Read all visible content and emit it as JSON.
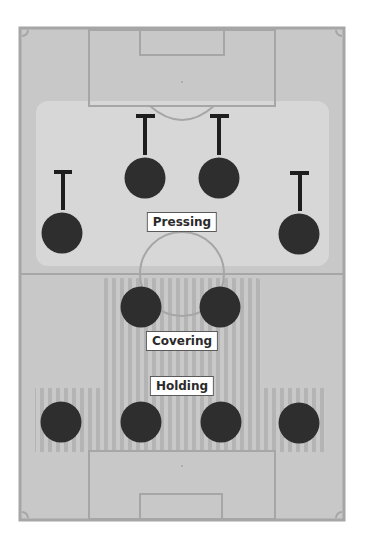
{
  "diagram": {
    "title": "",
    "type": "football-tactics-pitch",
    "colors": {
      "page_bg": "#ffffff",
      "pitch_bg": "#c8c8c8",
      "pitch_line": "#a6a6a6",
      "pressing_zone": "#d6d6d6",
      "stripe_dark": "#b3b3b3",
      "stripe_light": "#c9c9c9",
      "player": "#2e2e2e",
      "marker": "#1e1e1e",
      "label_bg": "#ffffff",
      "label_text": "#2b2b2b"
    },
    "zones": [
      {
        "id": "pressing",
        "label": "Pressing",
        "label_x": 182,
        "label_y": 222
      },
      {
        "id": "covering",
        "label": "Covering",
        "label_x": 182,
        "label_y": 341
      },
      {
        "id": "holding",
        "label": "Holding",
        "label_x": 182,
        "label_y": 386
      }
    ],
    "players": [
      {
        "role": "pressing",
        "x": 62,
        "y": 233,
        "marker": "T-up"
      },
      {
        "role": "pressing",
        "x": 145,
        "y": 178,
        "marker": "T-up"
      },
      {
        "role": "pressing",
        "x": 219,
        "y": 178,
        "marker": "T-up"
      },
      {
        "role": "pressing",
        "x": 299,
        "y": 234,
        "marker": "T-up"
      },
      {
        "role": "covering",
        "x": 141,
        "y": 307
      },
      {
        "role": "covering",
        "x": 220,
        "y": 307
      },
      {
        "role": "holding",
        "x": 61,
        "y": 422
      },
      {
        "role": "holding",
        "x": 141,
        "y": 422
      },
      {
        "role": "holding",
        "x": 221,
        "y": 422
      },
      {
        "role": "holding",
        "x": 299,
        "y": 423
      }
    ],
    "icons": [
      "player-disc-icon",
      "press-marker-t-icon"
    ]
  }
}
